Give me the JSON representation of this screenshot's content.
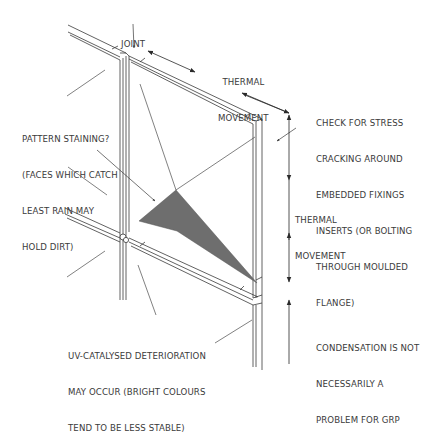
{
  "diagram": {
    "colors": {
      "line": "#3a3a3a",
      "stain_fill": "#6e6e6e",
      "background": "#ffffff"
    },
    "labels": {
      "joint": {
        "lines": [
          "JOINT"
        ]
      },
      "thermal_movement_top": {
        "lines": [
          "THERMAL",
          "MOVEMENT"
        ]
      },
      "pattern_staining": {
        "lines": [
          "PATTERN STAINING?",
          "(FACES WHICH CATCH",
          "LEAST RAIN MAY",
          "HOLD DIRT)"
        ]
      },
      "stress_cracking": {
        "lines": [
          "CHECK FOR STRESS",
          "CRACKING AROUND",
          "EMBEDDED FIXINGS",
          "INSERTS (OR BOLTING",
          "THROUGH MOULDED",
          "FLANGE)"
        ]
      },
      "thermal_movement_side": {
        "lines": [
          "THERMAL",
          "MOVEMENT"
        ]
      },
      "uv_deterioration": {
        "lines": [
          "UV-CATALYSED DETERIORATION",
          "MAY OCCUR (BRIGHT COLOURS",
          "TEND TO BE LESS STABLE)"
        ]
      },
      "condensation": {
        "lines": [
          "CONDENSATION IS NOT",
          "NECESSARILY A",
          "PROBLEM FOR GRP"
        ]
      }
    }
  }
}
